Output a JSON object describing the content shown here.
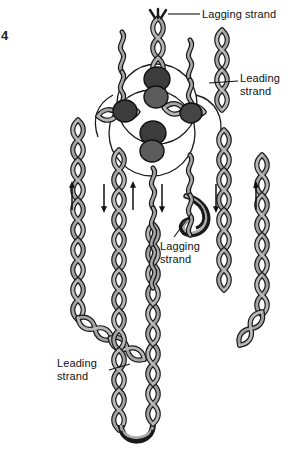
{
  "figure": {
    "number": "4",
    "background_color": "#ffffff",
    "width": 298,
    "height": 453
  },
  "colors": {
    "strand_fill": "#9e9e9e",
    "strand_fill_light": "#b5b5b5",
    "strand_outline": "#1a1a1a",
    "protein_dark": "#3a3a3a",
    "protein_mid": "#5a5a5a",
    "protein_outline": "#111111",
    "bubble_outline": "#1a1a1a",
    "label_text": "#111111",
    "leader_line": "#111111",
    "arrow": "#111111"
  },
  "labels": [
    {
      "id": "lagging-strand-top",
      "text": "Lagging strand",
      "lines": [
        "Lagging strand"
      ],
      "x": 202,
      "y": 8,
      "leader_from": [
        200,
        14
      ],
      "leader_to": [
        167,
        14
      ]
    },
    {
      "id": "leading-strand-right",
      "text": "Leading strand",
      "lines": [
        "Leading",
        "strand"
      ],
      "x": 240,
      "y": 72,
      "leader_from": [
        238,
        80
      ],
      "leader_to": [
        210,
        82
      ]
    },
    {
      "id": "lagging-strand-middle",
      "text": "Lagging strand",
      "lines": [
        "Lagging",
        "strand"
      ],
      "x": 160,
      "y": 240,
      "leader_from": [
        172,
        238
      ],
      "leader_to": [
        190,
        215
      ]
    },
    {
      "id": "leading-strand-lower",
      "text": "Leading strand",
      "lines": [
        "Leading",
        "strand"
      ],
      "x": 57,
      "y": 357,
      "leader_from": [
        108,
        370
      ],
      "leader_to": [
        128,
        364
      ]
    }
  ],
  "arrows": [
    {
      "id": "arrow-1",
      "x": 72,
      "direction": "up",
      "y_top": 184,
      "y_bottom": 210
    },
    {
      "id": "arrow-2",
      "x": 104,
      "direction": "down",
      "y_top": 184,
      "y_bottom": 210
    },
    {
      "id": "arrow-3",
      "x": 133,
      "direction": "up",
      "y_top": 184,
      "y_bottom": 210
    },
    {
      "id": "arrow-4",
      "x": 162,
      "direction": "down",
      "y_top": 184,
      "y_bottom": 210
    },
    {
      "id": "arrow-5",
      "x": 216,
      "direction": "down",
      "y_top": 184,
      "y_bottom": 210
    },
    {
      "id": "arrow-6",
      "x": 256,
      "direction": "up",
      "y_top": 184,
      "y_bottom": 210
    }
  ],
  "protein_complexes": [
    {
      "id": "protein-top-center",
      "cx": 157,
      "cy": 79,
      "rx": 13,
      "ry": 12
    },
    {
      "id": "protein-top-lower",
      "cx": 156,
      "cy": 96,
      "rx": 12,
      "ry": 11
    },
    {
      "id": "protein-left",
      "cx": 125,
      "cy": 111,
      "rx": 12,
      "ry": 11
    },
    {
      "id": "protein-right",
      "cx": 190,
      "cy": 113,
      "rx": 11,
      "ry": 10
    },
    {
      "id": "protein-mid-center",
      "cx": 153,
      "cy": 133,
      "rx": 13,
      "ry": 12
    },
    {
      "id": "protein-mid-lower",
      "cx": 152,
      "cy": 150,
      "rx": 12,
      "ry": 11
    }
  ],
  "replication_bubbles": [
    {
      "id": "bubble-upper",
      "cx": 157,
      "cy": 104,
      "r": 40
    },
    {
      "id": "bubble-lower",
      "cx": 152,
      "cy": 133,
      "r": 43
    }
  ],
  "strand_count": 6
}
